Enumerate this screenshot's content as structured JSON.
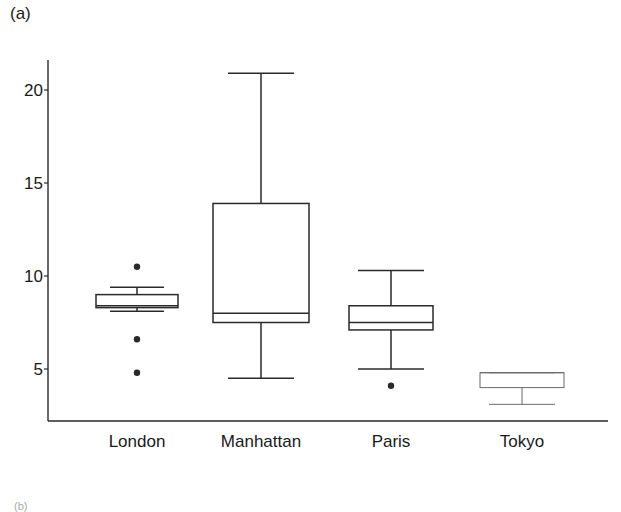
{
  "panel_label": "(a)",
  "next_panel_label": "(b)",
  "chart_data": {
    "type": "box",
    "title": "",
    "xlabel": "",
    "ylabel": "",
    "ylim": [
      2.3,
      22
    ],
    "yticks": [
      5,
      10,
      15,
      20
    ],
    "grid": false,
    "legend": null,
    "categories": [
      "London",
      "Manhattan",
      "Paris",
      "Tokyo"
    ],
    "series": [
      {
        "name": "London",
        "whisker_low": 8.1,
        "q1": 8.3,
        "median": 8.4,
        "q3": 9.0,
        "whisker_high": 9.4,
        "outliers": [
          10.5,
          6.6,
          4.8
        ]
      },
      {
        "name": "Manhattan",
        "whisker_low": 4.5,
        "q1": 7.5,
        "median": 8.0,
        "q3": 13.9,
        "whisker_high": 20.9,
        "outliers": []
      },
      {
        "name": "Paris",
        "whisker_low": 5.0,
        "q1": 7.1,
        "median": 7.5,
        "q3": 8.4,
        "whisker_high": 10.3,
        "outliers": [
          4.1
        ]
      },
      {
        "name": "Tokyo",
        "whisker_low": 3.1,
        "q1": 4.0,
        "median": 4.8,
        "q3": 4.8,
        "whisker_high": 4.8,
        "outliers": []
      }
    ]
  },
  "style": {
    "line_color": "#2a2a2a",
    "faint_line_color": "#6a6a6a",
    "background": "#ffffff"
  }
}
